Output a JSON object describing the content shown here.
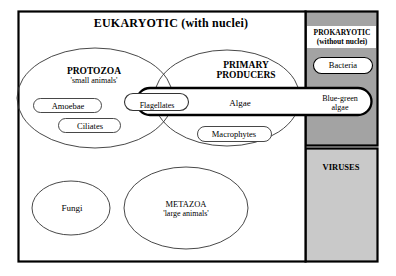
{
  "figure": {
    "frame": {
      "eukaryotic_title": "EUKARYOTIC (with nuclei)"
    },
    "groups": [
      {
        "name": "PROTOZOA",
        "subtitle": "'small animals'"
      },
      {
        "name": "PRIMARY",
        "name2": "PRODUCERS"
      },
      {
        "name": "METAZOA",
        "subtitle": "'large animals'"
      }
    ],
    "taxa": {
      "amoebae": "Amoebae",
      "ciliates": "Ciliates",
      "flagellates": "Flagellates",
      "algae": "Algae",
      "macrophytes": "Macrophytes",
      "fungi": "Fungi",
      "bacteria": "Bacteria",
      "blue_green_algae_line1": "Blue-green",
      "blue_green_algae_line2": "algae"
    },
    "right_column": {
      "prokaryotic_line1": "PROKARYOTIC",
      "prokaryotic_line2": "(without nuclei)",
      "viruses": "VIRUSES"
    },
    "colors": {
      "prokaryotic_fill": "#a3a3a3",
      "viruses_fill": "#c9c9c9",
      "stroke": "#000000",
      "page_background": "#ffffff",
      "shape_fill": "#ffffff"
    }
  }
}
